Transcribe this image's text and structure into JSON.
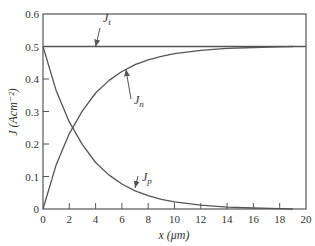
{
  "chart_data": {
    "type": "line",
    "title": "",
    "xlabel": "x (μm)",
    "ylabel": "J (Acm⁻²)",
    "xlim": [
      0,
      20
    ],
    "ylim": [
      0,
      0.6
    ],
    "xticks": [
      0,
      2,
      4,
      6,
      8,
      10,
      12,
      14,
      16,
      18,
      20
    ],
    "yticks": [
      0,
      0.1,
      0.2,
      0.3,
      0.4,
      0.5,
      0.6
    ],
    "ytick_labels": [
      "0",
      "0.1",
      "0.2",
      "0.3",
      "0.4",
      "0.5",
      "0.6"
    ],
    "grid": false,
    "legend": "none (curves annotated with arrows)",
    "series": [
      {
        "name": "J_t",
        "label_main": "J",
        "label_sub": "t",
        "x": [
          0,
          20
        ],
        "y": [
          0.5,
          0.5
        ]
      },
      {
        "name": "J_n",
        "label_main": "J",
        "label_sub": "n",
        "x": [
          0,
          1,
          2,
          3,
          4,
          5,
          6,
          7,
          8,
          9,
          10,
          12,
          14,
          16,
          18,
          19
        ],
        "y": [
          0,
          0.135,
          0.232,
          0.302,
          0.357,
          0.395,
          0.423,
          0.444,
          0.459,
          0.47,
          0.478,
          0.488,
          0.494,
          0.497,
          0.499,
          0.5
        ]
      },
      {
        "name": "J_p",
        "label_main": "J",
        "label_sub": "p",
        "x": [
          0,
          1,
          2,
          3,
          4,
          5,
          6,
          7,
          8,
          9,
          10,
          12,
          14,
          16,
          18,
          19
        ],
        "y": [
          0.5,
          0.365,
          0.268,
          0.198,
          0.143,
          0.105,
          0.077,
          0.056,
          0.041,
          0.03,
          0.022,
          0.012,
          0.006,
          0.003,
          0.001,
          0.0
        ]
      }
    ],
    "annotations": [
      {
        "text": "J_t",
        "points_to": [
          4,
          0.5
        ]
      },
      {
        "text": "J_n",
        "points_to": [
          6.3,
          0.43
        ]
      },
      {
        "text": "J_p",
        "points_to": [
          7,
          0.065
        ]
      }
    ]
  }
}
